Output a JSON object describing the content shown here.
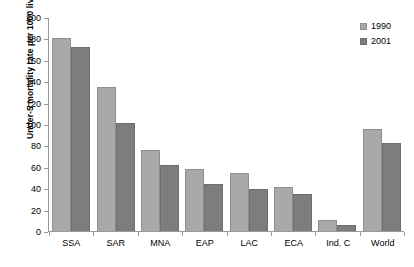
{
  "chart_data": {
    "type": "bar",
    "title": "",
    "xlabel": "",
    "ylabel": "Under-5 mortality rate per 1000 live births",
    "ylim": [
      0,
      200
    ],
    "yticks": [
      0,
      20,
      40,
      60,
      80,
      100,
      120,
      140,
      160,
      180,
      200
    ],
    "grid": false,
    "legend_position": "top-right",
    "categories": [
      "SSA",
      "SAR",
      "MNA",
      "EAP",
      "LAC",
      "ECA",
      "Ind. C",
      "World"
    ],
    "series": [
      {
        "name": "1990",
        "color": "#a9a9a9",
        "values": [
          180,
          135,
          76,
          58,
          54,
          41,
          10,
          95
        ]
      },
      {
        "name": "2001",
        "color": "#7d7d7d",
        "values": [
          172,
          101,
          62,
          44,
          39,
          35,
          6,
          82
        ]
      }
    ]
  },
  "legend": {
    "entries": [
      {
        "label": "1990"
      },
      {
        "label": "2001"
      }
    ]
  },
  "colors": {
    "series_1990": "#a9a9a9",
    "series_2001": "#7d7d7d",
    "axis": "#9a9a9a",
    "text": "#000000",
    "background": "#ffffff"
  }
}
